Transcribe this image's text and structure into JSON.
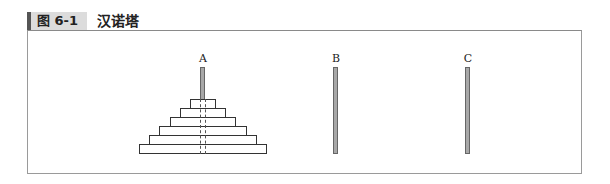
{
  "caption": {
    "label": "图 6-1",
    "title": "汉诺塔"
  },
  "diagram": {
    "rods": [
      {
        "label": "A",
        "x": 203,
        "disks": 6
      },
      {
        "label": "B",
        "x": 336,
        "disks": 0
      },
      {
        "label": "C",
        "x": 468,
        "disks": 0
      }
    ],
    "disk_widths": [
      126,
      106,
      86,
      66,
      46,
      26
    ],
    "colors": {
      "rod_fill": "#a8a8a8",
      "rod_border": "#666666",
      "disk_border": "#333333"
    }
  }
}
